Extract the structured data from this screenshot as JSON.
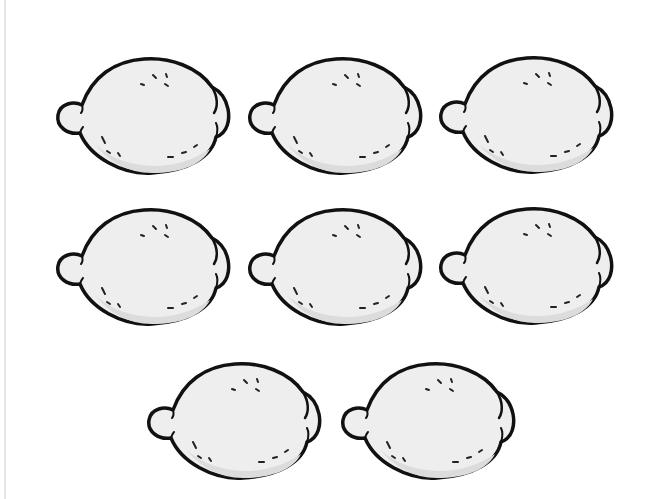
{
  "image": {
    "description": "Illustration of eight lemons arranged in three rows (3, 3, 2)",
    "background": "#ffffff",
    "lemon_fill": "#eeeeee",
    "lemon_shadow": "#dcdcdc",
    "outline": "#111111",
    "count": 8,
    "rows": [
      {
        "count": 3,
        "items": [
          {
            "x": 52,
            "y": 53
          },
          {
            "x": 244,
            "y": 53
          },
          {
            "x": 435,
            "y": 52
          }
        ]
      },
      {
        "count": 3,
        "items": [
          {
            "x": 52,
            "y": 204
          },
          {
            "x": 244,
            "y": 204
          },
          {
            "x": 435,
            "y": 203
          }
        ]
      },
      {
        "count": 2,
        "items": [
          {
            "x": 143,
            "y": 358
          },
          {
            "x": 337,
            "y": 358
          }
        ]
      }
    ]
  }
}
